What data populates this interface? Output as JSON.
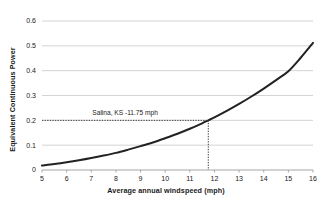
{
  "chart_data": {
    "type": "line",
    "title": "",
    "xlabel": "Average annual windspeed (mph)",
    "ylabel": "Equivalent Continuous Power",
    "xlim": [
      5,
      16
    ],
    "ylim": [
      0,
      0.6
    ],
    "xticks": [
      "5",
      "6",
      "7",
      "8",
      "9",
      "10",
      "11",
      "12",
      "13",
      "14",
      "15",
      "16"
    ],
    "yticks": [
      "0",
      "0.1",
      "0.2",
      "0.3",
      "0.4",
      "0.5",
      "0.6"
    ],
    "grid": "horizontal",
    "legend": "none",
    "series": [
      {
        "name": "Equivalent Continuous Power",
        "color": "#222222",
        "x": [
          5,
          5.5,
          6,
          6.5,
          7,
          7.5,
          8,
          8.5,
          9,
          9.5,
          10,
          10.5,
          11,
          11.5,
          11.75,
          12,
          12.5,
          13,
          13.5,
          14,
          14.5,
          15,
          15.5,
          16
        ],
        "values": [
          0.018,
          0.024,
          0.031,
          0.039,
          0.048,
          0.058,
          0.069,
          0.082,
          0.096,
          0.111,
          0.128,
          0.146,
          0.166,
          0.188,
          0.2,
          0.212,
          0.238,
          0.266,
          0.296,
          0.328,
          0.362,
          0.398,
          0.452,
          0.512
        ]
      }
    ],
    "annotations": [
      {
        "label": "Salina, KS -11.75 mph",
        "x": 11.75,
        "y": 0.2,
        "guide_style": "dotted",
        "guide_color": "#3a3a3a"
      }
    ]
  },
  "colors": {
    "curve": "#222222",
    "gridline": "#d4d4d4",
    "axis": "#a6a6a6",
    "text": "#1a1a1a",
    "guide": "#3a3a3a",
    "background": "#ffffff"
  }
}
